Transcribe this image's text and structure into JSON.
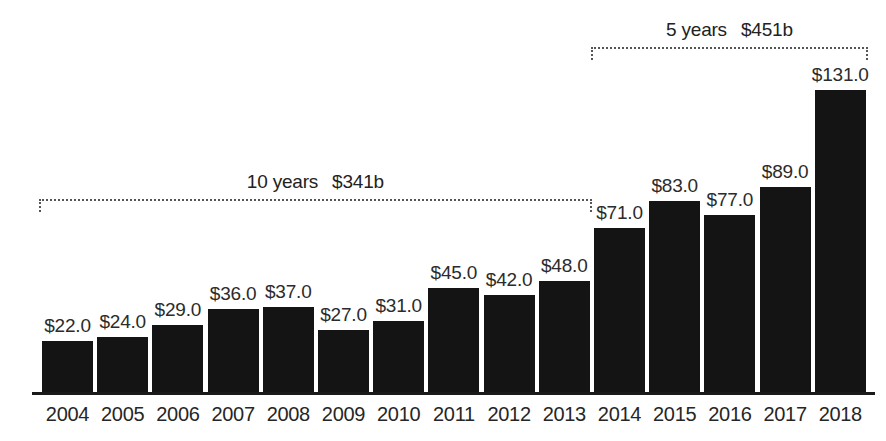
{
  "chart_data": {
    "type": "bar",
    "title": "",
    "subtitle": "",
    "xlabel": "",
    "ylabel": "",
    "categories": [
      "2004",
      "2005",
      "2006",
      "2007",
      "2008",
      "2009",
      "2010",
      "2011",
      "2012",
      "2013",
      "2014",
      "2015",
      "2016",
      "2017",
      "2018"
    ],
    "values": [
      22,
      24,
      29,
      36,
      37,
      27,
      31,
      45,
      42,
      48,
      71,
      83,
      77,
      89,
      131
    ],
    "value_labels": [
      "$22.0",
      "$24.0",
      "$29.0",
      "$36.0",
      "$37.0",
      "$27.0",
      "$31.0",
      "$45.0",
      "$42.0",
      "$48.0",
      "$71.0",
      "$83.0",
      "$77.0",
      "$89.0",
      "$131.0"
    ],
    "ylim": [
      0,
      131
    ],
    "grid": false,
    "legend": null,
    "bar_color": "#141414",
    "annotations": [
      {
        "id": "ten-year-span",
        "period": "10 years",
        "total": "$341b",
        "start_category": "2004",
        "end_category": "2013"
      },
      {
        "id": "five-year-span",
        "period": "5 years",
        "total": "$451b",
        "start_category": "2014",
        "end_category": "2018"
      }
    ]
  },
  "colors": {
    "bar": "#141414",
    "axis": "#1a1a1a",
    "value_text": "#2b2b2b",
    "tick_text": "#262626",
    "bracket": "#555555",
    "background": "#ffffff"
  }
}
